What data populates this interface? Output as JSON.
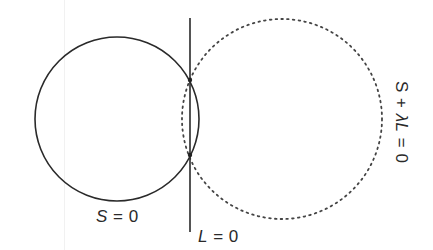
{
  "diagram": {
    "circle_s": {
      "label_var": "S",
      "label_rest": " = 0",
      "style": "solid",
      "cx": 117,
      "cy": 119,
      "r": 82,
      "color": "#2a2a2a"
    },
    "line_l": {
      "label_var": "L",
      "label_rest": " = 0",
      "style": "solid",
      "x": 190,
      "y1": 18,
      "y2": 232,
      "color": "#2a2a2a"
    },
    "circle_family": {
      "label_prefix": "S + ",
      "label_var": "λL",
      "label_rest": " = 0",
      "style": "dotted",
      "cx": 282,
      "cy": 119,
      "r": 100,
      "color": "#444444"
    },
    "intersection_points": [
      {
        "x": 190,
        "y": 80
      },
      {
        "x": 190,
        "y": 155
      }
    ]
  }
}
